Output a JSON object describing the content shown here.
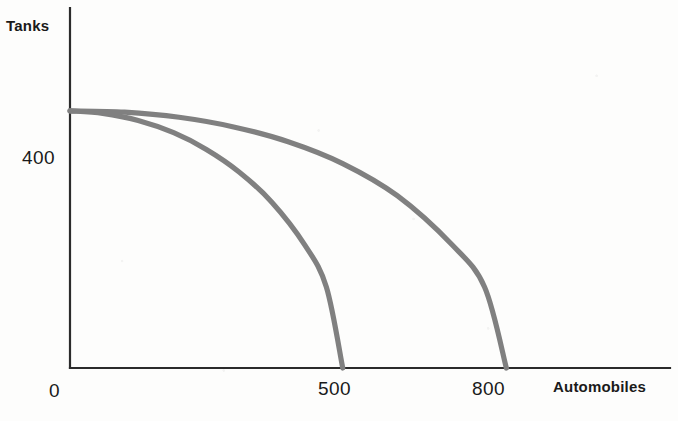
{
  "chart_data": {
    "type": "line",
    "title": "",
    "subtitle": "",
    "xlabel": "Automobiles",
    "ylabel": "Tanks",
    "xlim": [
      0,
      1100
    ],
    "ylim": [
      0,
      560
    ],
    "grid": false,
    "legend_position": "none",
    "annotations": [],
    "x_tick_labels": [
      "0",
      "500",
      "800"
    ],
    "x_tick_values": [
      0,
      500,
      800
    ],
    "y_tick_labels": [
      "400"
    ],
    "y_tick_values": [
      400
    ],
    "series": [
      {
        "name": "Outer production possibilities frontier",
        "color": "#808080",
        "x_intercept": 800,
        "y_intercept": 400,
        "points": [
          {
            "x": 0,
            "y": 400
          },
          {
            "x": 100,
            "y": 398
          },
          {
            "x": 200,
            "y": 390
          },
          {
            "x": 300,
            "y": 375
          },
          {
            "x": 400,
            "y": 352
          },
          {
            "x": 500,
            "y": 318
          },
          {
            "x": 600,
            "y": 268
          },
          {
            "x": 700,
            "y": 192
          },
          {
            "x": 760,
            "y": 126
          },
          {
            "x": 800,
            "y": 0
          }
        ]
      },
      {
        "name": "Inner production possibilities frontier",
        "color": "#808080",
        "x_intercept": 500,
        "y_intercept": 400,
        "points": [
          {
            "x": 0,
            "y": 400
          },
          {
            "x": 60,
            "y": 396
          },
          {
            "x": 125,
            "y": 385
          },
          {
            "x": 190,
            "y": 366
          },
          {
            "x": 250,
            "y": 340
          },
          {
            "x": 310,
            "y": 305
          },
          {
            "x": 370,
            "y": 258
          },
          {
            "x": 430,
            "y": 192
          },
          {
            "x": 470,
            "y": 126
          },
          {
            "x": 500,
            "y": 0
          }
        ]
      }
    ]
  },
  "labels": {
    "y_axis_title": "Tanks",
    "x_axis_title": "Automobiles",
    "y_tick_400": "400",
    "x_tick_0": "0",
    "x_tick_500": "500",
    "x_tick_800": "800"
  },
  "colors": {
    "curve": "#808080",
    "axis": "#2b2b2b",
    "text": "#1a1a1a",
    "background": "#fdfdfc"
  }
}
